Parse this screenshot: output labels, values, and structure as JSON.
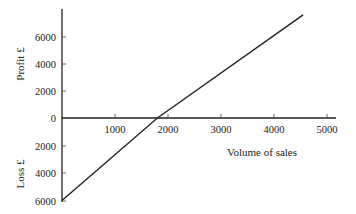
{
  "chart_data": {
    "type": "line",
    "title": "",
    "xlabel": "Volume of sales",
    "ylabel_top": "Profit £",
    "ylabel_bottom": "Loss £",
    "x_ticks": [
      1000,
      2000,
      3000,
      4000,
      5000
    ],
    "y_ticks_profit": [
      2000,
      4000,
      6000
    ],
    "y_ticks_loss": [
      2000,
      4000,
      6000
    ],
    "y_zero_label": "0",
    "xlim": [
      0,
      5200
    ],
    "ylim": [
      -6000,
      7600
    ],
    "grid": false,
    "series": [
      {
        "name": "Profit/Loss",
        "x": [
          0,
          1800,
          4550
        ],
        "y": [
          -6000,
          0,
          7500
        ]
      }
    ],
    "break_even_volume": 1800
  },
  "labels": {
    "x_ticks": [
      "1000",
      "2000",
      "3000",
      "4000",
      "5000"
    ],
    "y_profit": [
      "2000",
      "4000",
      "6000"
    ],
    "y_loss": [
      "2000",
      "4000",
      "6000"
    ],
    "zero": "0",
    "xlabel": "Volume of sales",
    "ylabel_top": "Profit £",
    "ylabel_bottom": "Loss £"
  }
}
